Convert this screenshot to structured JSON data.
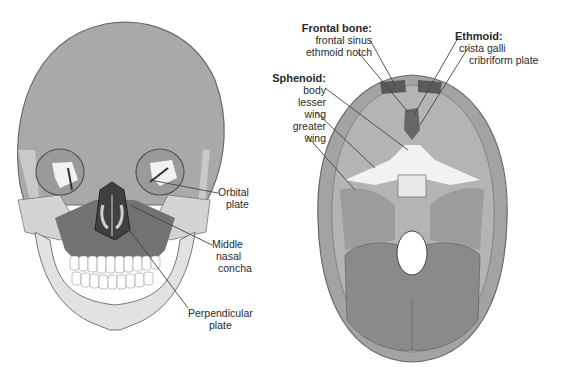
{
  "figure": {
    "left_panel": {
      "name": "Anterior view of skull",
      "labels": {
        "orbital_plate": [
          "Orbital",
          "plate"
        ],
        "middle_nasal_concha": [
          "Middle",
          "nasal",
          "concha"
        ],
        "perpendicular_plate": [
          "Perpendicular",
          "plate"
        ]
      }
    },
    "right_panel": {
      "name": "Superior view of cranial floor",
      "frontal_bone": {
        "header": "Frontal bone:",
        "items": [
          "frontal sinus",
          "ethmoid notch"
        ]
      },
      "sphenoid": {
        "header": "Sphenoid:",
        "items": [
          "body",
          "lesser",
          "wing",
          "greater",
          "wing"
        ]
      },
      "ethmoid": {
        "header": "Ethmoid:",
        "items": [
          "crista galli",
          "cribriform plate"
        ]
      }
    },
    "colors": {
      "bone_light": "#d6d6d6",
      "bone_mid": "#a9a9a9",
      "bone_dark": "#6f6f6f",
      "highlight": "#f4f4f4",
      "outline": "#555555",
      "label_text": "#2a2a2a"
    }
  }
}
